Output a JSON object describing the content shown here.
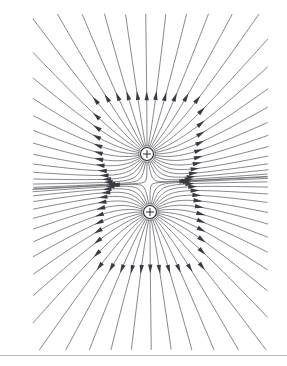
{
  "figure": {
    "type": "field-line-diagram",
    "background_color": "#ffffff",
    "line_color": "#5e5e66",
    "arrow_color": "#3a3a42",
    "charge_color": "#2b2b31",
    "rule_color": "#b9b9bf",
    "canvas": {
      "width": 287,
      "height": 366
    }
  },
  "charges": [
    {
      "label": "+",
      "name": "upper-positive-charge",
      "sign": "positive",
      "x": 147,
      "y": 154,
      "radius": 6.5,
      "lines": 36
    },
    {
      "label": "+",
      "name": "lower-positive-charge",
      "sign": "positive",
      "x": 150,
      "y": 212,
      "radius": 6.5,
      "lines": 36
    }
  ],
  "neutral_point": {
    "name": "saddle-point",
    "x": 148.5,
    "y": 183,
    "label": ""
  },
  "field": {
    "direction": "outward",
    "arrowheads_per_line": 1,
    "line_count_total": 72,
    "stroke_width": 0.75,
    "arrow_length": 9,
    "arrow_width": 4.4,
    "arrow_fraction": 0.42
  },
  "footer_rule": {
    "name": "footer-divider",
    "y": 355,
    "color": "#b9b9bf",
    "thickness": 1
  },
  "caption": "Field lines radiate outward from two like (positive) point charges; lines repel between the charges forming a neutral saddle point."
}
